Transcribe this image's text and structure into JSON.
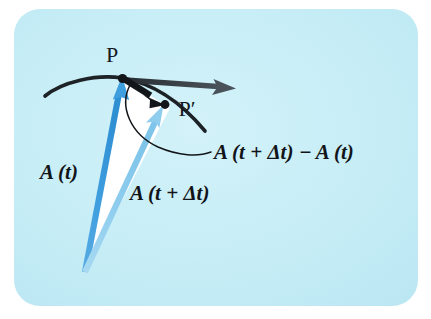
{
  "figure": {
    "type": "vector-derivative-diagram",
    "background_color": "#c7eef7",
    "panel": {
      "x": 14,
      "y": 9,
      "width": 404,
      "height": 297,
      "corner_radius": 26,
      "fill": "#c7eef7"
    },
    "page_background": "#ffffff"
  },
  "colors": {
    "vector_A_t": "#3f9ede",
    "vector_A_t_dt": "#8fcdee",
    "curve": "#1b2026",
    "tangent_arrow": "#3b4349",
    "delta_arrow": "#12161a",
    "leader_line": "#12161a",
    "interior_fill": "#ffffff",
    "label_text": "#111418",
    "point_text": "#15191d"
  },
  "points": {
    "origin": {
      "x": 85,
      "y": 272,
      "label": ""
    },
    "P": {
      "x": 122,
      "y": 78,
      "label": "P",
      "label_x": 112,
      "label_y": 62
    },
    "P_prime": {
      "x": 164,
      "y": 104,
      "label": "P′",
      "label_x": 188,
      "label_y": 114
    }
  },
  "labels": {
    "point_P": "P",
    "point_P_prime": "P′",
    "vector_A_t": "A (t)",
    "vector_A_t_delta": "A (t + Δt)",
    "difference": "A (t + Δt) − A (t)"
  },
  "label_parts": {
    "A_symbol": "A",
    "open_paren": "(",
    "close_paren": ")",
    "t": "t",
    "plus": "+",
    "delta_t": "Δt",
    "minus": "−"
  },
  "label_positions": {
    "vector_A_t": {
      "x": 42,
      "y": 177
    },
    "vector_A_t_delta": {
      "x": 132,
      "y": 198
    },
    "difference": {
      "x": 215,
      "y": 158
    }
  },
  "geometry": {
    "curve_path": "M 45 96 C 62 82, 96 74, 122 78 C 146 82, 176 96, 205 131",
    "tangent_arrow": {
      "from_x": 124,
      "from_y": 79,
      "to_x": 233,
      "to_y": 88
    },
    "delta_arrow": {
      "from_x": 124,
      "from_y": 79,
      "to_x": 164,
      "to_y": 104
    },
    "leader_path": "M 129 84 C 120 104, 130 133, 158 146 C 178 155, 196 156, 210 153",
    "vector_A_t_line": {
      "from_x": 85,
      "from_y": 272,
      "to_x": 122,
      "to_y": 78
    },
    "vector_A_t_delta_line": {
      "from_x": 85,
      "from_y": 272,
      "to_x": 164,
      "to_y": 104
    },
    "interior_triangle": "M 85 272 L 122 78 L 164 104 Z"
  },
  "font_sizes": {
    "math_label": 21,
    "point_label": 22
  }
}
